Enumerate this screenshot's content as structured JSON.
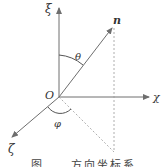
{
  "diagram": {
    "labels": {
      "xi_axis": "ξ",
      "chi_axis": "χ",
      "zeta_axis": "ζ",
      "origin": "O",
      "vector": "n",
      "theta": "θ",
      "phi": "φ"
    },
    "caption": "图 ...  方向坐标系",
    "colors": {
      "line": "#6e6e6e",
      "dashed": "#9a9a9a",
      "text": "#333333"
    }
  }
}
